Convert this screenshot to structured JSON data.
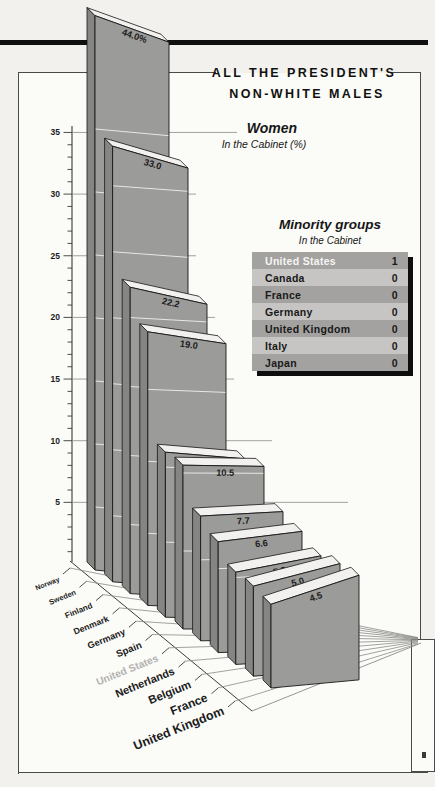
{
  "header": {
    "title_line1": "ALL THE PRESIDENT'S",
    "title_line2": "NON-WHITE MALES"
  },
  "chart_data": {
    "type": "bar",
    "title": "Women",
    "subtitle": "In the Cabinet (%)",
    "categories": [
      "Norway",
      "Sweden",
      "Finland",
      "Denmark",
      "Germany",
      "Spain",
      "United States",
      "Netherlands",
      "Belgium",
      "France",
      "United Kingdom"
    ],
    "values": [
      44.0,
      33.0,
      22.2,
      19.0,
      11.0,
      10.5,
      7.7,
      6.6,
      5.3,
      5.0,
      4.5
    ],
    "value_labels": [
      "44.0%",
      "33.0",
      "22.2",
      "19.0",
      "11.0",
      "10.5",
      "7.7",
      "6.6",
      "5.3",
      "5.0",
      "4.5"
    ],
    "highlighted_category": "United States",
    "ylim": [
      0,
      35
    ],
    "yticks": [
      5,
      10,
      15,
      20,
      25,
      30,
      35
    ],
    "minor_tick_step": 1,
    "grid": true,
    "projection": "3d-perspective"
  },
  "minority_table": {
    "title": "Minority groups",
    "subtitle": "In the Cabinet",
    "rows": [
      {
        "country": "United States",
        "value": "1",
        "highlight": true
      },
      {
        "country": "Canada",
        "value": "0",
        "highlight": false
      },
      {
        "country": "France",
        "value": "0",
        "highlight": false
      },
      {
        "country": "Germany",
        "value": "0",
        "highlight": false
      },
      {
        "country": "United Kingdom",
        "value": "0",
        "highlight": false
      },
      {
        "country": "Italy",
        "value": "0",
        "highlight": false
      },
      {
        "country": "Japan",
        "value": "0",
        "highlight": false
      }
    ]
  },
  "colors": {
    "bar_face": "#9b9b99",
    "bar_top": "#f2f1ef",
    "bar_side": "#858583",
    "bar_outline": "#161616",
    "grid_dark": "#8a8a88",
    "grid_white": "#ffffff",
    "axis": "#3a3a38",
    "label_dark": "#1c1c1c",
    "label_highlight": "#b3b2b0",
    "table_row_dark": "#a3a2a0",
    "table_row_light": "#c6c5c3",
    "table_text": "#191919",
    "table_text_highlight": "#f6f5f3"
  }
}
